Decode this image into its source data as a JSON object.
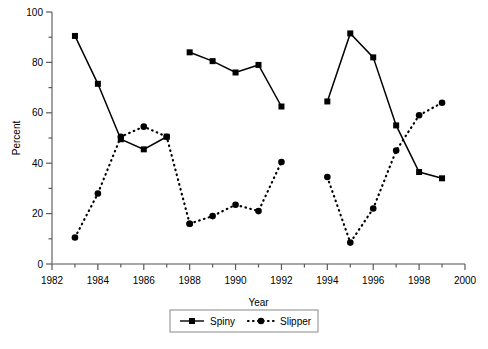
{
  "chart_data": {
    "type": "line",
    "title": "",
    "xlabel": "Year",
    "ylabel": "Percent",
    "xlim": [
      1982,
      2000
    ],
    "ylim": [
      0,
      100
    ],
    "xticks": [
      1982,
      1984,
      1986,
      1988,
      1990,
      1992,
      1994,
      1996,
      1998,
      2000
    ],
    "xtick_labels": [
      "1982",
      "1984",
      "1986",
      "1988",
      "1990",
      "1992",
      "1994",
      "1996",
      "1998",
      "2000"
    ],
    "x_minor_step": 1,
    "yticks": [
      0,
      20,
      40,
      60,
      80,
      100
    ],
    "ytick_labels": [
      "0",
      "20",
      "40",
      "60",
      "80",
      "100"
    ],
    "y_minor_step": 10,
    "grid": false,
    "legend_position": "bottom-center",
    "series": [
      {
        "name": "Spiny",
        "marker": "square",
        "linestyle": "solid",
        "color": "#000000",
        "segments": [
          {
            "x": [
              1983,
              1984,
              1985,
              1986,
              1987
            ],
            "y": [
              90.5,
              71.5,
              49.5,
              45.5,
              50.5
            ]
          },
          {
            "x": [
              1988,
              1989,
              1990,
              1991,
              1992
            ],
            "y": [
              84,
              80.5,
              76,
              79,
              62.5
            ]
          },
          {
            "x": [
              1994,
              1995,
              1996,
              1997,
              1998,
              1999
            ],
            "y": [
              64.5,
              91.5,
              82,
              55,
              36.5,
              34
            ]
          }
        ]
      },
      {
        "name": "Slipper",
        "marker": "circle",
        "linestyle": "dotted",
        "color": "#000000",
        "segments": [
          {
            "x": [
              1983,
              1984,
              1985,
              1986,
              1987,
              1988
            ],
            "y": [
              10.5,
              28,
              50.5,
              54.5,
              50.5,
              16
            ]
          },
          {
            "x": [
              1988,
              1989,
              1990,
              1991,
              1992
            ],
            "y": [
              16,
              19,
              23.5,
              21,
              40.5
            ]
          },
          {
            "x": [
              1994,
              1995,
              1996,
              1997,
              1998,
              1999
            ],
            "y": [
              34.5,
              8.5,
              22,
              45,
              59,
              64
            ]
          }
        ]
      }
    ],
    "legend": [
      {
        "label": "Spiny",
        "marker": "square",
        "linestyle": "solid"
      },
      {
        "label": "Slipper",
        "marker": "circle",
        "linestyle": "dotted"
      }
    ]
  }
}
